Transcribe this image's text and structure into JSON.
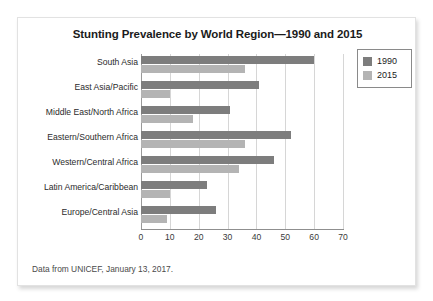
{
  "figure": {
    "title": "Stunting Prevalence by World Region—1990 and 2015",
    "caption": "Data from UNICEF, January 13, 2017."
  },
  "legend": {
    "items": [
      {
        "label": "1990",
        "color": "#7d7d7d"
      },
      {
        "label": "2015",
        "color": "#b4b4b4"
      }
    ]
  },
  "chart_data": {
    "type": "bar",
    "orientation": "horizontal",
    "title": "Stunting Prevalence by World Region—1990 and 2015",
    "xlabel": "",
    "ylabel": "",
    "xlim": [
      0,
      70
    ],
    "xticks": [
      0,
      10,
      20,
      30,
      40,
      50,
      60,
      70
    ],
    "grid": "vertical",
    "legend_position": "top-right",
    "categories": [
      "South Asia",
      "East Asia/Pacific",
      "Middle East/North Africa",
      "Eastern/Southern Africa",
      "Western/Central Africa",
      "Latin America/Caribbean",
      "Europe/Central Asia"
    ],
    "series": [
      {
        "name": "1990",
        "color": "#7d7d7d",
        "values": [
          60,
          41,
          31,
          52,
          46,
          23,
          26
        ]
      },
      {
        "name": "2015",
        "color": "#b4b4b4",
        "values": [
          36,
          10,
          18,
          36,
          34,
          10,
          9
        ]
      }
    ]
  }
}
